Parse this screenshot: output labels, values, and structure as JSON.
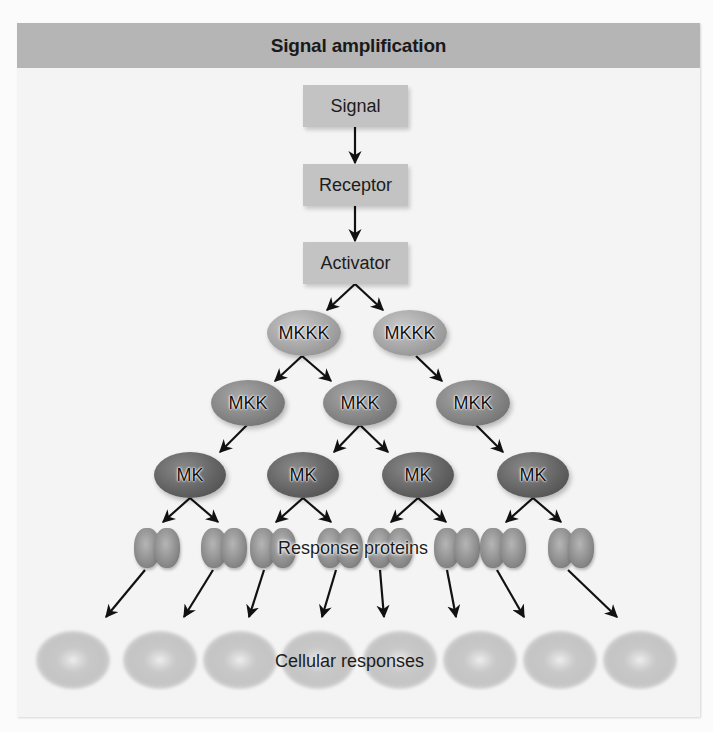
{
  "figure": {
    "title": "Signal amplification",
    "colors": {
      "header_bg": "#b5b5b5",
      "panel_bg": "#f4f4f4",
      "box_bg": "#c3c3c3",
      "arrow": "#111111"
    }
  },
  "chain": {
    "signal": "Signal",
    "receptor": "Receptor",
    "activator": "Activator"
  },
  "tiers": {
    "mkkk": [
      "MKKK",
      "MKKK"
    ],
    "mkk": [
      "MKK",
      "MKK",
      "MKK"
    ],
    "mk": [
      "MK",
      "MK",
      "MK",
      "MK"
    ]
  },
  "labels": {
    "response_proteins": "Response proteins",
    "cellular_responses": "Cellular responses"
  },
  "counts": {
    "response_proteins": 8,
    "cellular_responses": 8
  }
}
